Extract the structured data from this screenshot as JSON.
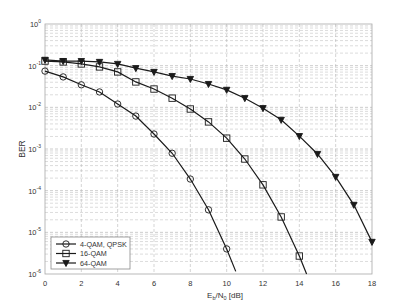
{
  "chart_data": {
    "type": "line",
    "title": "",
    "xlabel": "Eb/N0 [dB]",
    "xlabel_parts": {
      "main": "E",
      "sub1": "b",
      "mid": "/N",
      "sub2": "0",
      "tail": " [dB]"
    },
    "ylabel": "BER",
    "yscale": "log",
    "xlim": [
      0,
      18
    ],
    "ylim": [
      1e-06,
      1
    ],
    "grid": true,
    "legend_position": "lower left",
    "x_ticks": [
      0,
      2,
      4,
      6,
      8,
      10,
      12,
      14,
      16,
      18
    ],
    "y_ticks": [
      {
        "exp": "0"
      },
      {
        "exp": "-1"
      },
      {
        "exp": "-2"
      },
      {
        "exp": "-3"
      },
      {
        "exp": "-4"
      },
      {
        "exp": "-5"
      },
      {
        "exp": "-6"
      }
    ],
    "series": [
      {
        "name": "4-QAM, QPSK",
        "marker": "circle",
        "x": [
          0,
          1,
          2,
          3,
          4,
          5,
          6,
          7,
          8,
          9,
          10
        ],
        "values": [
          0.0741,
          0.0537,
          0.0347,
          0.0234,
          0.012,
          0.00617,
          0.00229,
          0.00079,
          0.00019,
          3.47e-05,
          4e-06
        ],
        "tail_to_x": 10.5
      },
      {
        "name": "16-QAM",
        "marker": "square",
        "x": [
          0,
          1,
          2,
          3,
          4,
          5,
          6,
          7,
          8,
          9,
          10,
          11,
          12,
          13,
          14
        ],
        "values": [
          0.129,
          0.123,
          0.11,
          0.0933,
          0.0708,
          0.0407,
          0.0275,
          0.0166,
          0.00912,
          0.00447,
          0.00182,
          0.000575,
          0.000138,
          2.34e-05,
          2.7e-06
        ],
        "tail_to_x": 14.45
      },
      {
        "name": "64-QAM",
        "marker": "triangle-down",
        "x": [
          0,
          1,
          2,
          3,
          4,
          5,
          6,
          7,
          8,
          9,
          10,
          11,
          12,
          13,
          14,
          15,
          16,
          17,
          18
        ],
        "values": [
          0.138,
          0.129,
          0.129,
          0.123,
          0.11,
          0.0871,
          0.0708,
          0.0562,
          0.0479,
          0.0363,
          0.0263,
          0.0166,
          0.00955,
          0.00501,
          0.00204,
          0.000759,
          0.000214,
          4.57e-05,
          5.9e-06
        ],
        "tail_to_x": 18
      }
    ]
  },
  "colors": {
    "line": "#1a1a1a",
    "grid": "#b8b8b8",
    "axis": "#9a9a9a",
    "text": "#333333"
  }
}
